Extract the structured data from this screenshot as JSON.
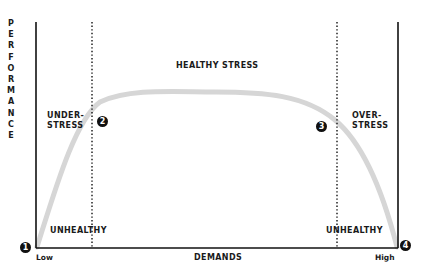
{
  "diagram": {
    "y_axis_label": "PERFORMANCE",
    "x_axis_label": "DEMANDS",
    "x_low": "Low",
    "x_high": "High",
    "regions": {
      "left_top": [
        "UNDER-",
        "STRESS"
      ],
      "center": "HEALTHY STRESS",
      "right_top": [
        "OVER-",
        "STRESS"
      ],
      "left_bottom": "UNHEALTHY",
      "right_bottom": "UNHEALTHY"
    },
    "markers": [
      "1",
      "2",
      "3",
      "4"
    ],
    "colors": {
      "axis": "#111111",
      "curve": "#d9d9d9",
      "text": "#1a1a1a"
    }
  }
}
